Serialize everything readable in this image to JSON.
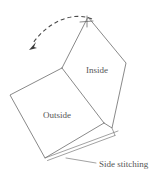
{
  "figure": {
    "labels": {
      "inside": "Inside",
      "outside": "Outside",
      "side_stitching": "Side stitching"
    },
    "colors": {
      "background": "#ffffff",
      "outline": "#6b6b6b",
      "seam": "#7a7a7a",
      "arrow": "#3a3a3a",
      "text": "#555555"
    },
    "annotations": {
      "fold_arrow": "dashed-curved-arrow",
      "fold_direction": "counter-clockwise-to-left",
      "top_tick": "fold-registration-tick",
      "seam": "double-line-side-seam"
    },
    "geometry": {
      "outside_panel": "10,95 62,68 104,123 45,158",
      "inside_panel": "62,68 88,17 126,63 112,128 104,123",
      "fold_edge": "62,68 104,123",
      "seam_outer": "45,158 118,131",
      "seam_inner": "47,160 116,134",
      "arc_start": "92,18",
      "arc_end": "32,46",
      "leader_start": "66,158",
      "leader_end": "95,163"
    }
  }
}
